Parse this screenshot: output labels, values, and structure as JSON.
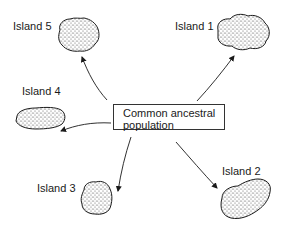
{
  "diagram": {
    "center": {
      "line1": "Common ancestral",
      "line2": "population"
    },
    "islands": [
      {
        "id": 1,
        "label": "Island 1"
      },
      {
        "id": 2,
        "label": "Island 2"
      },
      {
        "id": 3,
        "label": "Island 3"
      },
      {
        "id": 4,
        "label": "Island 4"
      },
      {
        "id": 5,
        "label": "Island 5"
      }
    ],
    "colors": {
      "ink": "#1a1a1a",
      "background": "#ffffff"
    }
  }
}
